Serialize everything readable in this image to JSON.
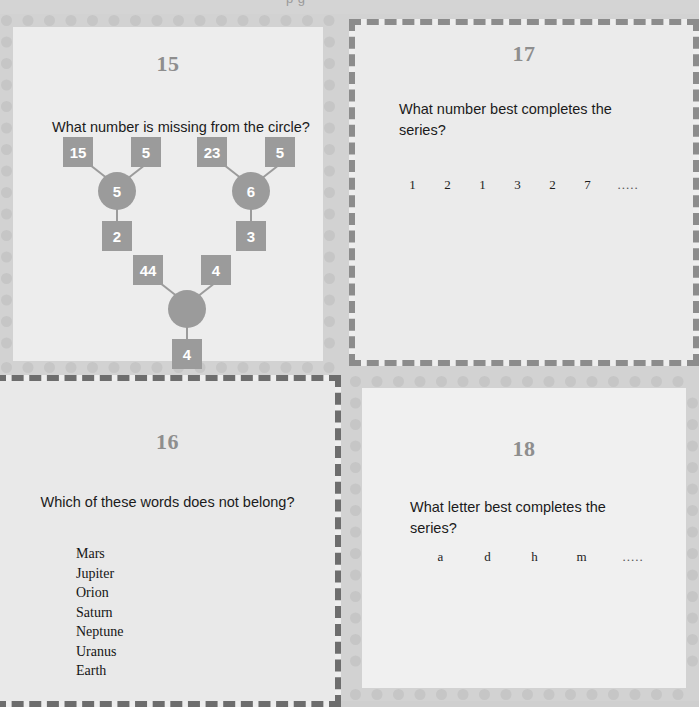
{
  "page": {
    "header_fragment": "p g",
    "background_color": "#d2d2d2",
    "panel_background": "#ededed",
    "node_color": "#9b9b9b",
    "number_color": "#8e8e8e",
    "dash_border_dark": "#6d6d6d",
    "dot_border_color": "#c6c6c6"
  },
  "panels": {
    "p15": {
      "number": "15",
      "question": "What number is missing from the circle?",
      "border_style": "dotted-circles",
      "diagram": {
        "groups": [
          {
            "name": "left-group",
            "top_left_box": "15",
            "top_right_box": "5",
            "center_circle": "5",
            "bottom_box": "2"
          },
          {
            "name": "right-group",
            "top_left_box": "23",
            "top_right_box": "5",
            "center_circle": "6",
            "bottom_box": "3"
          },
          {
            "name": "bottom-group",
            "top_left_box": "44",
            "top_right_box": "4",
            "center_circle": "",
            "bottom_box": "4"
          }
        ]
      }
    },
    "p17": {
      "number": "17",
      "question": "What number best completes the series?",
      "border_style": "dashed",
      "series": [
        "1",
        "2",
        "1",
        "3",
        "2",
        "7"
      ],
      "series_ellipsis": "....."
    },
    "p16": {
      "number": "16",
      "question": "Which of these words does not belong?",
      "border_style": "dashed",
      "words": [
        "Mars",
        "Jupiter",
        "Orion",
        "Saturn",
        "Neptune",
        "Uranus",
        "Earth"
      ]
    },
    "p18": {
      "number": "18",
      "question": "What letter best completes the series?",
      "border_style": "dotted-circles",
      "series": [
        "a",
        "d",
        "h",
        "m"
      ],
      "series_ellipsis": "....."
    }
  }
}
